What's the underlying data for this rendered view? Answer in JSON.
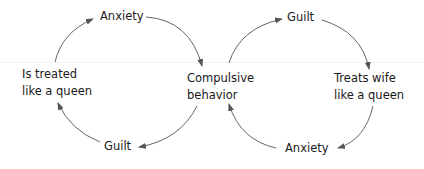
{
  "diagram": {
    "type": "causal-loop",
    "loops": [
      {
        "name": "left-loop",
        "nodes": {
          "top": "Anxiety",
          "left_line1": "Is treated",
          "left_line2": "like a queen",
          "bottom": "Guilt"
        }
      },
      {
        "name": "right-loop",
        "nodes": {
          "top": "Guilt",
          "right_line1": "Treats wife",
          "right_line2": "like a queen",
          "bottom": "Anxiety"
        }
      }
    ],
    "center": {
      "line1": "Compulsive",
      "line2": "behavior"
    },
    "edges": [
      {
        "from": "Is treated like a queen",
        "to": "Anxiety"
      },
      {
        "from": "Anxiety",
        "to": "Compulsive behavior"
      },
      {
        "from": "Compulsive behavior",
        "to": "Guilt (left)"
      },
      {
        "from": "Guilt (left)",
        "to": "Is treated like a queen"
      },
      {
        "from": "Compulsive behavior",
        "to": "Guilt (right)"
      },
      {
        "from": "Guilt (right)",
        "to": "Treats wife like a queen"
      },
      {
        "from": "Treats wife like a queen",
        "to": "Anxiety (right)"
      },
      {
        "from": "Anxiety (right)",
        "to": "Compulsive behavior"
      }
    ],
    "colors": {
      "text": "#1a1a1a",
      "arrow": "#555555"
    }
  }
}
